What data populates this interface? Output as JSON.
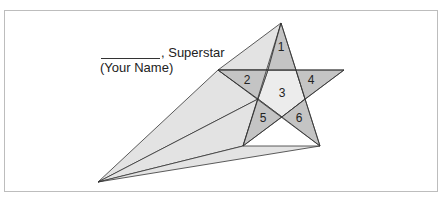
{
  "caption": {
    "name_blank": "",
    "suffix": ", Superstar",
    "hint": "(Your Name)"
  },
  "star": {
    "regions": [
      {
        "id": "1",
        "label": "1"
      },
      {
        "id": "2",
        "label": "2"
      },
      {
        "id": "3",
        "label": "3"
      },
      {
        "id": "4",
        "label": "4"
      },
      {
        "id": "5",
        "label": "5"
      },
      {
        "id": "6",
        "label": "6"
      }
    ]
  },
  "colors": {
    "tail_fill": "#e3e3e3",
    "center_fill": "#ececec",
    "tip_fill": "#c4c4c4",
    "stroke": "#333333",
    "border": "#bdbdbd"
  }
}
